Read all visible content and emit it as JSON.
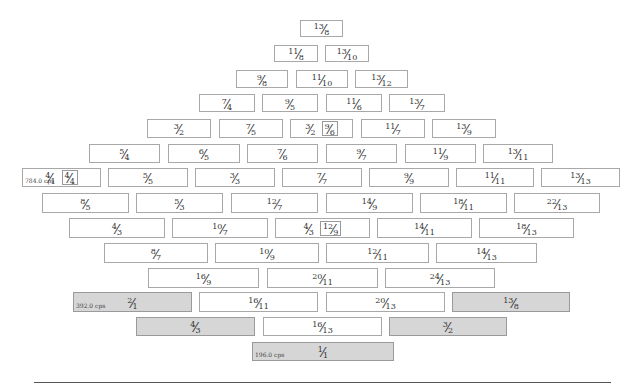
{
  "rows": [
    {
      "y": 20,
      "h": 17,
      "cells": [
        {
          "x": 300,
          "w": 43,
          "n": "13",
          "d": "8"
        }
      ]
    },
    {
      "y": 45,
      "h": 17,
      "cells": [
        {
          "x": 274,
          "w": 44,
          "n": "11",
          "d": "8"
        },
        {
          "x": 325,
          "w": 44,
          "n": "13",
          "d": "10"
        }
      ]
    },
    {
      "y": 70,
      "h": 18,
      "cells": [
        {
          "x": 236,
          "w": 52,
          "n": "9",
          "d": "8"
        },
        {
          "x": 296,
          "w": 52,
          "n": "11",
          "d": "10"
        },
        {
          "x": 355,
          "w": 53,
          "n": "13",
          "d": "12"
        }
      ]
    },
    {
      "y": 94,
      "h": 18,
      "cells": [
        {
          "x": 199,
          "w": 56,
          "n": "7",
          "d": "4"
        },
        {
          "x": 262,
          "w": 56,
          "n": "9",
          "d": "5"
        },
        {
          "x": 326,
          "w": 56,
          "n": "11",
          "d": "6"
        },
        {
          "x": 389,
          "w": 56,
          "n": "13",
          "d": "7"
        }
      ]
    },
    {
      "y": 119,
      "h": 19,
      "cells": [
        {
          "x": 147,
          "w": 64,
          "n": "3",
          "d": "2"
        },
        {
          "x": 219,
          "w": 64,
          "n": "7",
          "d": "5"
        },
        {
          "x": 290,
          "w": 63,
          "n": "3",
          "d": "2",
          "alt_n": "9",
          "alt_d": "6"
        },
        {
          "x": 361,
          "w": 64,
          "n": "11",
          "d": "7"
        },
        {
          "x": 432,
          "w": 64,
          "n": "13",
          "d": "9"
        }
      ]
    },
    {
      "y": 144,
      "h": 19,
      "cells": [
        {
          "x": 89,
          "w": 71,
          "n": "5",
          "d": "4"
        },
        {
          "x": 168,
          "w": 72,
          "n": "6",
          "d": "5"
        },
        {
          "x": 247,
          "w": 71,
          "n": "7",
          "d": "6"
        },
        {
          "x": 326,
          "w": 71,
          "n": "9",
          "d": "7"
        },
        {
          "x": 405,
          "w": 71,
          "n": "11",
          "d": "9"
        },
        {
          "x": 483,
          "w": 70,
          "n": "13",
          "d": "11"
        }
      ]
    },
    {
      "y": 168,
      "h": 19,
      "cells": [
        {
          "x": 22,
          "w": 79,
          "n": "4",
          "d": "1",
          "alt_n": "4",
          "alt_d": "4",
          "cps": "784.0 cps"
        },
        {
          "x": 108,
          "w": 80,
          "n": "5",
          "d": "5"
        },
        {
          "x": 195,
          "w": 80,
          "n": "3",
          "d": "3"
        },
        {
          "x": 282,
          "w": 80,
          "n": "7",
          "d": "7"
        },
        {
          "x": 369,
          "w": 80,
          "n": "9",
          "d": "9"
        },
        {
          "x": 456,
          "w": 78,
          "n": "11",
          "d": "11"
        },
        {
          "x": 541,
          "w": 79,
          "n": "13",
          "d": "13"
        }
      ]
    },
    {
      "y": 193,
      "h": 20,
      "cells": [
        {
          "x": 42,
          "w": 87,
          "n": "8",
          "d": "5"
        },
        {
          "x": 136,
          "w": 87,
          "n": "5",
          "d": "3"
        },
        {
          "x": 231,
          "w": 87,
          "n": "12",
          "d": "7"
        },
        {
          "x": 326,
          "w": 87,
          "n": "14",
          "d": "9"
        },
        {
          "x": 420,
          "w": 87,
          "n": "18",
          "d": "11"
        },
        {
          "x": 514,
          "w": 86,
          "n": "22",
          "d": "13"
        }
      ]
    },
    {
      "y": 218,
      "h": 20,
      "cells": [
        {
          "x": 69,
          "w": 96,
          "n": "4",
          "d": "3"
        },
        {
          "x": 172,
          "w": 96,
          "n": "10",
          "d": "7"
        },
        {
          "x": 275,
          "w": 95,
          "n": "4",
          "d": "3",
          "alt_n": "12",
          "alt_d": "9"
        },
        {
          "x": 377,
          "w": 95,
          "n": "14",
          "d": "11"
        },
        {
          "x": 479,
          "w": 95,
          "n": "18",
          "d": "13"
        }
      ]
    },
    {
      "y": 243,
      "h": 20,
      "cells": [
        {
          "x": 104,
          "w": 104,
          "n": "8",
          "d": "7"
        },
        {
          "x": 215,
          "w": 104,
          "n": "10",
          "d": "9"
        },
        {
          "x": 326,
          "w": 103,
          "n": "12",
          "d": "11"
        },
        {
          "x": 436,
          "w": 101,
          "n": "14",
          "d": "13"
        }
      ]
    },
    {
      "y": 268,
      "h": 20,
      "cells": [
        {
          "x": 148,
          "w": 111,
          "n": "16",
          "d": "9"
        },
        {
          "x": 267,
          "w": 111,
          "n": "20",
          "d": "11"
        },
        {
          "x": 385,
          "w": 110,
          "n": "24",
          "d": "13"
        }
      ]
    },
    {
      "y": 292,
      "h": 20,
      "cells": [
        {
          "x": 73,
          "w": 119,
          "n": "2",
          "d": "1",
          "hl": true,
          "cps": "392.0 cps"
        },
        {
          "x": 199,
          "w": 119,
          "n": "16",
          "d": "11"
        },
        {
          "x": 326,
          "w": 119,
          "n": "20",
          "d": "13"
        },
        {
          "x": 452,
          "w": 118,
          "n": "13",
          "d": "8",
          "hl": true
        }
      ]
    },
    {
      "y": 317,
      "h": 19,
      "cells": [
        {
          "x": 136,
          "w": 119,
          "n": "4",
          "d": "3",
          "hl": true
        },
        {
          "x": 263,
          "w": 119,
          "n": "16",
          "d": "13"
        },
        {
          "x": 389,
          "w": 118,
          "n": "3",
          "d": "2",
          "hl": true
        }
      ]
    },
    {
      "y": 342,
      "h": 19,
      "cells": [
        {
          "x": 252,
          "w": 142,
          "n": "1",
          "d": "1",
          "hl": true,
          "cps": "196.0 cps"
        }
      ]
    }
  ]
}
